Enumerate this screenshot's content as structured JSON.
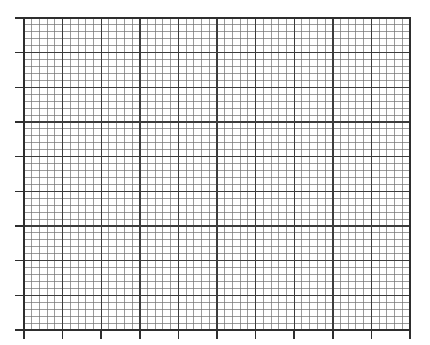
{
  "page": {
    "width": 430,
    "height": 345,
    "background_color": "#ffffff"
  },
  "chart_data": {
    "type": "line",
    "title": "",
    "subtitle": "",
    "xlabel": "",
    "ylabel": "",
    "series": [],
    "categories": [],
    "x": [],
    "values": [],
    "annotations": [],
    "legend": {
      "entries": [],
      "position": "none",
      "visible": false
    },
    "grid": {
      "visible": true,
      "style": "graph-paper",
      "major_color": "#3c3c3c",
      "minor_color": "#707070",
      "major_width": 1.4,
      "minor_width": 0.7,
      "minor_per_major": 5
    },
    "plot_area": {
      "left": 24,
      "top": 18,
      "right": 410,
      "bottom": 330,
      "width": 386,
      "height": 312,
      "border_color": "#2e2e2e",
      "border_width": 1.6
    },
    "xaxis": {
      "min": 0,
      "max": 10,
      "major_step": 1,
      "minor_step": 0.2,
      "major_count": 10,
      "tick_labels": [],
      "tick_marks": {
        "visible": true,
        "side": "outside-bottom",
        "length": 9,
        "color": "#2e2e2e",
        "width": 1.5
      }
    },
    "yaxis": {
      "min": 0,
      "max": 8.4,
      "major_step": 1,
      "minor_step": 0.2,
      "major_count": 9,
      "tick_labels": [],
      "tick_marks": {
        "visible": true,
        "side": "outside-left",
        "length": 9,
        "color": "#2e2e2e",
        "width": 1.5
      }
    },
    "data_points_present": false,
    "note": "Empty graph paper: ruled grid with major and minor divisions, outward tick marks on the left and bottom axes, and no plotted series, labels, or legend."
  }
}
